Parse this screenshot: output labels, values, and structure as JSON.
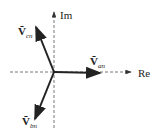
{
  "diagram": {
    "type": "phasor-diagram",
    "axes": {
      "real_label": "Re",
      "imag_label": "Im"
    },
    "phasors": [
      {
        "name": "V_an",
        "symbol": "Ṽ",
        "subscript": "an",
        "angle_deg": 0
      },
      {
        "name": "V_bn",
        "symbol": "Ṽ",
        "subscript": "bn",
        "angle_deg": -120
      },
      {
        "name": "V_cn",
        "symbol": "Ṽ",
        "subscript": "cn",
        "angle_deg": 120
      }
    ]
  }
}
